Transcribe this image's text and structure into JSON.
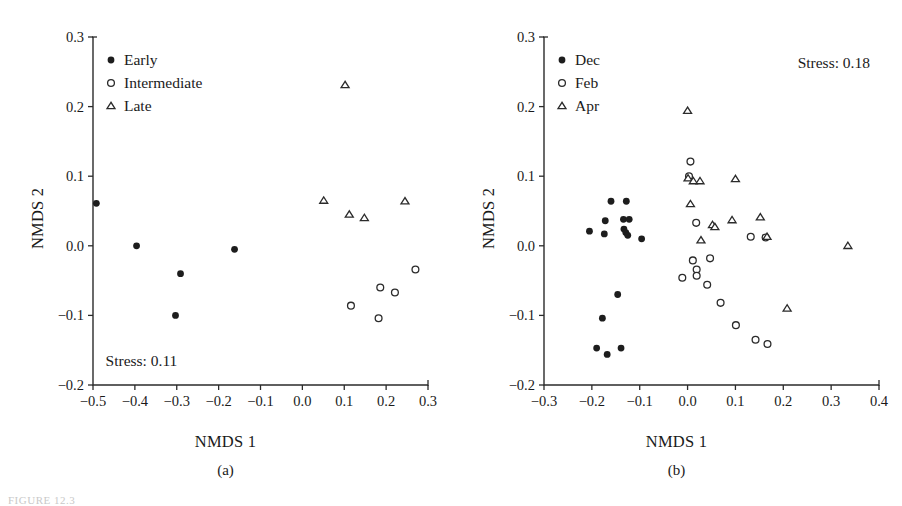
{
  "figure": {
    "caption_fragment": "FIGURE 12.3",
    "panels": [
      "a",
      "b"
    ]
  },
  "chart_data": [
    {
      "type": "scatter",
      "panel": "a",
      "panel_label": "(a)",
      "title": "",
      "xlabel": "NMDS 1",
      "ylabel": "NMDS 2",
      "xlim": [
        -0.5,
        0.3
      ],
      "ylim": [
        -0.2,
        0.3
      ],
      "xticks": [
        -0.5,
        -0.4,
        -0.3,
        -0.2,
        -0.1,
        0.0,
        0.1,
        0.2,
        0.3
      ],
      "xticklabels": [
        "−0.5",
        "−0.4",
        "−0.3",
        "−0.2",
        "−0.1",
        "0.0",
        "0.1",
        "0.2",
        "0.3"
      ],
      "yticks": [
        -0.2,
        -0.1,
        0.0,
        0.1,
        0.2,
        0.3
      ],
      "yticklabels": [
        "−0.2",
        "−0.1",
        "0.0",
        "0.1",
        "0.2",
        "0.3"
      ],
      "grid": false,
      "legend_position": "top-left",
      "annotations": [
        {
          "text": "Stress: 0.11",
          "x": -0.47,
          "y": -0.165,
          "align": "left"
        }
      ],
      "series": [
        {
          "name": "Early",
          "marker": "filled-circle",
          "points": [
            {
              "x": -0.492,
              "y": 0.061
            },
            {
              "x": -0.396,
              "y": 0.0
            },
            {
              "x": -0.291,
              "y": -0.04
            },
            {
              "x": -0.303,
              "y": -0.1
            },
            {
              "x": -0.162,
              "y": -0.005
            }
          ]
        },
        {
          "name": "Intermediate",
          "marker": "open-circle",
          "points": [
            {
              "x": 0.116,
              "y": -0.086
            },
            {
              "x": 0.186,
              "y": -0.06
            },
            {
              "x": 0.182,
              "y": -0.104
            },
            {
              "x": 0.221,
              "y": -0.067
            },
            {
              "x": 0.27,
              "y": -0.034
            }
          ]
        },
        {
          "name": "Late",
          "marker": "open-triangle",
          "points": [
            {
              "x": 0.102,
              "y": 0.231
            },
            {
              "x": 0.051,
              "y": 0.065
            },
            {
              "x": 0.112,
              "y": 0.045
            },
            {
              "x": 0.148,
              "y": 0.04
            },
            {
              "x": 0.245,
              "y": 0.064
            }
          ]
        }
      ]
    },
    {
      "type": "scatter",
      "panel": "b",
      "panel_label": "(b)",
      "title": "",
      "xlabel": "NMDS 1",
      "ylabel": "NMDS 2",
      "xlim": [
        -0.3,
        0.4
      ],
      "ylim": [
        -0.2,
        0.3
      ],
      "xticks": [
        -0.3,
        -0.2,
        -0.1,
        0.0,
        0.1,
        0.2,
        0.3,
        0.4
      ],
      "xticklabels": [
        "−0.3",
        "−0.2",
        "−0.1",
        "0.0",
        "0.1",
        "0.2",
        "0.3",
        "0.4"
      ],
      "yticks": [
        -0.2,
        -0.1,
        0.0,
        0.1,
        0.2,
        0.3
      ],
      "yticklabels": [
        "−0.2",
        "−0.1",
        "0.0",
        "0.1",
        "0.2",
        "0.3"
      ],
      "grid": false,
      "legend_position": "top-left",
      "annotations": [
        {
          "text": "Stress: 0.18",
          "x": 0.23,
          "y": 0.262,
          "align": "left"
        }
      ],
      "series": [
        {
          "name": "Dec",
          "marker": "filled-circle",
          "points": [
            {
              "x": -0.205,
              "y": 0.021
            },
            {
              "x": -0.172,
              "y": 0.036
            },
            {
              "x": -0.174,
              "y": 0.017
            },
            {
              "x": -0.16,
              "y": 0.064
            },
            {
              "x": -0.128,
              "y": 0.064
            },
            {
              "x": -0.134,
              "y": 0.038
            },
            {
              "x": -0.122,
              "y": 0.038
            },
            {
              "x": -0.133,
              "y": 0.024
            },
            {
              "x": -0.129,
              "y": 0.019
            },
            {
              "x": -0.125,
              "y": 0.015
            },
            {
              "x": -0.096,
              "y": 0.01
            },
            {
              "x": -0.146,
              "y": -0.07
            },
            {
              "x": -0.178,
              "y": -0.104
            },
            {
              "x": -0.19,
              "y": -0.147
            },
            {
              "x": -0.168,
              "y": -0.156
            },
            {
              "x": -0.139,
              "y": -0.147
            }
          ]
        },
        {
          "name": "Feb",
          "marker": "open-circle",
          "points": [
            {
              "x": 0.006,
              "y": 0.121
            },
            {
              "x": 0.003,
              "y": 0.1
            },
            {
              "x": 0.018,
              "y": 0.033
            },
            {
              "x": 0.132,
              "y": 0.013
            },
            {
              "x": 0.163,
              "y": 0.012
            },
            {
              "x": 0.011,
              "y": -0.021
            },
            {
              "x": 0.047,
              "y": -0.018
            },
            {
              "x": 0.019,
              "y": -0.034
            },
            {
              "x": 0.019,
              "y": -0.043
            },
            {
              "x": -0.011,
              "y": -0.046
            },
            {
              "x": 0.041,
              "y": -0.056
            },
            {
              "x": 0.069,
              "y": -0.082
            },
            {
              "x": 0.101,
              "y": -0.114
            },
            {
              "x": 0.142,
              "y": -0.135
            },
            {
              "x": 0.167,
              "y": -0.141
            }
          ]
        },
        {
          "name": "Apr",
          "marker": "open-triangle",
          "points": [
            {
              "x": 0.0,
              "y": 0.194
            },
            {
              "x": 0.001,
              "y": 0.097
            },
            {
              "x": 0.012,
              "y": 0.093
            },
            {
              "x": 0.026,
              "y": 0.093
            },
            {
              "x": 0.1,
              "y": 0.096
            },
            {
              "x": 0.006,
              "y": 0.06
            },
            {
              "x": 0.052,
              "y": 0.03
            },
            {
              "x": 0.057,
              "y": 0.027
            },
            {
              "x": 0.093,
              "y": 0.037
            },
            {
              "x": 0.152,
              "y": 0.041
            },
            {
              "x": 0.028,
              "y": 0.008
            },
            {
              "x": 0.166,
              "y": 0.013
            },
            {
              "x": 0.335,
              "y": 0.0
            },
            {
              "x": 0.208,
              "y": -0.09
            }
          ]
        }
      ]
    }
  ]
}
